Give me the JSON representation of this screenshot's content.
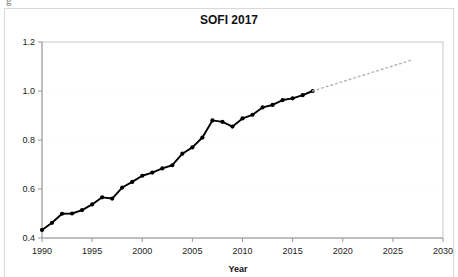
{
  "figure": {
    "scan_artifact": "g",
    "background_color": "#ffffff",
    "frame_color": "#d9d9d9"
  },
  "chart_data": {
    "type": "line",
    "title": "SOFI 2017",
    "xlabel": "Year",
    "ylabel": "",
    "xlim": [
      1990,
      2030
    ],
    "ylim": [
      0.4,
      1.2
    ],
    "xticks": [
      1990,
      1995,
      2000,
      2005,
      2010,
      2015,
      2020,
      2025,
      2030
    ],
    "xtick_labels": [
      "1990",
      "1995",
      "2000",
      "2005",
      "2010",
      "2015",
      "2020",
      "2025",
      "2030"
    ],
    "yticks": [
      0.4,
      0.6,
      0.8,
      1.0,
      1.2
    ],
    "ytick_labels": [
      "0.4",
      "0.6",
      "0.8",
      "1.0",
      "1.2"
    ],
    "grid": true,
    "grid_axis": "y",
    "legend": false,
    "series": [
      {
        "name": "SOFI observed",
        "style": "solid-with-markers",
        "color": "#000000",
        "x": [
          1990,
          1991,
          1992,
          1993,
          1994,
          1995,
          1996,
          1997,
          1998,
          1999,
          2000,
          2001,
          2002,
          2003,
          2004,
          2005,
          2006,
          2007,
          2008,
          2009,
          2010,
          2011,
          2012,
          2013,
          2014,
          2015,
          2016,
          2017
        ],
        "values": [
          0.433,
          0.462,
          0.499,
          0.5,
          0.514,
          0.537,
          0.566,
          0.561,
          0.606,
          0.629,
          0.654,
          0.667,
          0.684,
          0.697,
          0.744,
          0.77,
          0.81,
          0.88,
          0.874,
          0.855,
          0.888,
          0.903,
          0.933,
          0.943,
          0.963,
          0.97,
          0.983,
          1.0
        ]
      },
      {
        "name": "SOFI projection",
        "style": "dotted",
        "color": "#b0b0b0",
        "x": [
          2017,
          2027
        ],
        "values": [
          1.0,
          1.128
        ]
      }
    ]
  }
}
